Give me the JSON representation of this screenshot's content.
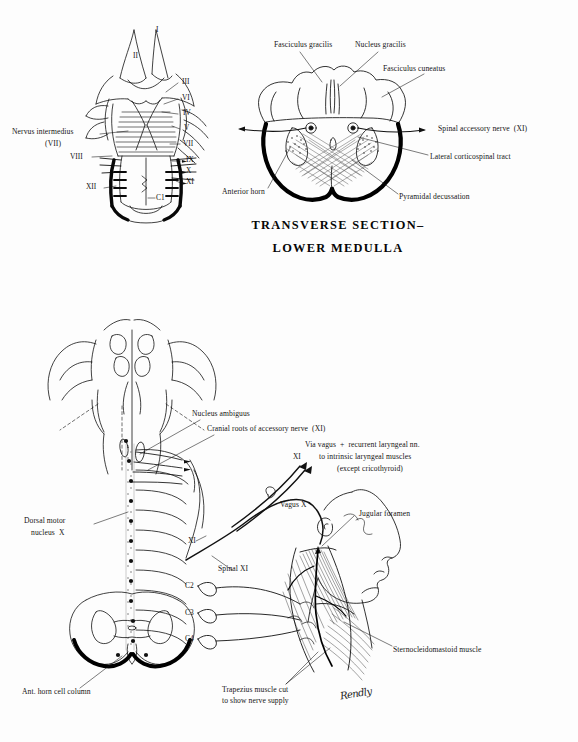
{
  "page": {
    "background": "#fdfdfd",
    "ink": "#111111",
    "width": 578,
    "height": 742
  },
  "figures": {
    "dorsal_brainstem": {
      "name": "Dorsal view of brainstem with cranial nerve roots",
      "left_labels": [
        {
          "text": "Nervus intermedius",
          "x": 12,
          "y": 130
        },
        {
          "text": "(VII)",
          "x": 45,
          "y": 142
        },
        {
          "text": "VIII",
          "x": 72,
          "y": 155
        },
        {
          "text": "XII",
          "x": 88,
          "y": 185
        }
      ],
      "right_labels": [
        {
          "text": "I",
          "x": 156,
          "y": 29
        },
        {
          "text": "II",
          "x": 136,
          "y": 55
        },
        {
          "text": "III",
          "x": 182,
          "y": 81
        },
        {
          "text": "VI",
          "x": 182,
          "y": 97
        },
        {
          "text": "IV",
          "x": 182,
          "y": 112
        },
        {
          "text": "V",
          "x": 182,
          "y": 127
        },
        {
          "text": "VII",
          "x": 182,
          "y": 142
        },
        {
          "text": "IX",
          "x": 183,
          "y": 159
        },
        {
          "text": "X",
          "x": 183,
          "y": 170
        },
        {
          "text": "XI",
          "x": 183,
          "y": 181
        },
        {
          "text": "C1",
          "x": 156,
          "y": 197
        }
      ]
    },
    "transverse_section": {
      "name": "Transverse section of lower medulla",
      "title_line1": "TRANSVERSE SECTION–",
      "title_line2": "LOWER MEDULLA",
      "labels": [
        {
          "text": "Fasciculus gracilis",
          "x": 274,
          "y": 44
        },
        {
          "text": "Nucleus gracilis",
          "x": 354,
          "y": 44
        },
        {
          "text": "Fasciculus cuneatus",
          "x": 383,
          "y": 67
        },
        {
          "text": "Spinal accessory nerve  (XI)",
          "x": 440,
          "y": 127
        },
        {
          "text": "Lateral corticospinal tract",
          "x": 430,
          "y": 155
        },
        {
          "text": "Pyramidal decussation",
          "x": 400,
          "y": 196
        },
        {
          "text": "Anterior horn",
          "x": 224,
          "y": 190
        }
      ]
    },
    "lower_plate": {
      "name": "Accessory nerve course from medulla to neck muscles",
      "labels": [
        {
          "text": "Nucleus ambiguus",
          "x": 192,
          "y": 412
        },
        {
          "text": "Cranial roots of accessory nerve  (XI)",
          "x": 207,
          "y": 427
        },
        {
          "text": "Via vagus  +  recurrent laryngeal nn.",
          "x": 305,
          "y": 443
        },
        {
          "text": "to intrinsic laryngeal muscles",
          "x": 320,
          "y": 455
        },
        {
          "text": "(except cricothyroid)",
          "x": 337,
          "y": 467
        },
        {
          "text": "XI",
          "x": 293,
          "y": 455
        },
        {
          "text": "Vagus X",
          "x": 281,
          "y": 503
        },
        {
          "text": "Jugular foramen",
          "x": 360,
          "y": 512
        },
        {
          "text": "Dorsal motor",
          "x": 24,
          "y": 519
        },
        {
          "text": "nucleus  X",
          "x": 31,
          "y": 531
        },
        {
          "text": "XI",
          "x": 188,
          "y": 539
        },
        {
          "text": "Spinal XI",
          "x": 218,
          "y": 567
        },
        {
          "text": "C2",
          "x": 186,
          "y": 584
        },
        {
          "text": "C3",
          "x": 186,
          "y": 611
        },
        {
          "text": "C4",
          "x": 186,
          "y": 637
        },
        {
          "text": "Sternocleidomastoid muscle",
          "x": 394,
          "y": 648
        },
        {
          "text": "Ant. horn cell column",
          "x": 22,
          "y": 690
        },
        {
          "text": "Trapezius muscle cut",
          "x": 222,
          "y": 688
        },
        {
          "text": "to show nerve supply",
          "x": 222,
          "y": 699
        }
      ],
      "signature": "Rendly"
    }
  }
}
